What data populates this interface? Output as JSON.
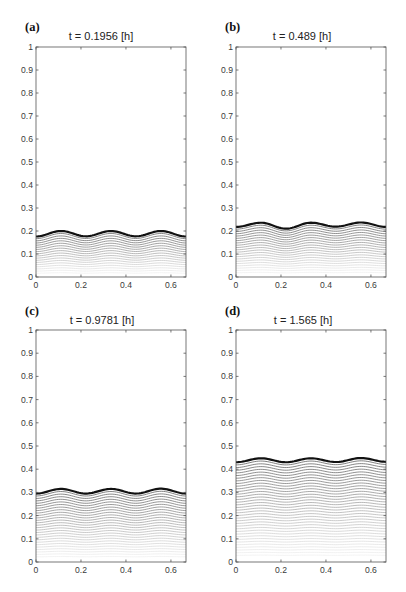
{
  "figure": {
    "panels": [
      {
        "label": "(a)",
        "title": "t = 0.1956 [h]"
      },
      {
        "label": "(b)",
        "title": "t = 0.489 [h]"
      },
      {
        "label": "(c)",
        "title": "t = 0.9781 [h]"
      },
      {
        "label": "(d)",
        "title": "t = 1.565 [h]"
      }
    ]
  },
  "chart_data": [
    {
      "type": "line",
      "panel": "(a)",
      "title": "t = 0.1956 [h]",
      "xlabel": "",
      "ylabel": "",
      "xlim": [
        0,
        0.667
      ],
      "ylim": [
        0,
        1
      ],
      "xticks": [
        0,
        0.2,
        0.4,
        0.6
      ],
      "xtick_labels": [
        "0",
        "0.2",
        "0.4",
        "0.6"
      ],
      "yticks": [
        0,
        0.1,
        0.2,
        0.3,
        0.4,
        0.5,
        0.6,
        0.7,
        0.8,
        0.9,
        1
      ],
      "ytick_labels": [
        "0",
        "0.1",
        "0.2",
        "0.3",
        "0.4",
        "0.5",
        "0.6",
        "0.7",
        "0.8",
        "0.9",
        "1"
      ],
      "grid": false,
      "legend": null,
      "layer_count": 18,
      "series": [
        {
          "name": "interface (current)",
          "x": [
            0,
            0.111,
            0.222,
            0.333,
            0.444,
            0.556,
            0.667
          ],
          "y": [
            0.176,
            0.2,
            0.177,
            0.2,
            0.177,
            0.2,
            0.176
          ]
        }
      ]
    },
    {
      "type": "line",
      "panel": "(b)",
      "title": "t = 0.489 [h]",
      "xlabel": "",
      "ylabel": "",
      "xlim": [
        0,
        0.667
      ],
      "ylim": [
        0,
        1
      ],
      "xticks": [
        0,
        0.2,
        0.4,
        0.6
      ],
      "xtick_labels": [
        "0",
        "0.2",
        "0.4",
        "0.6"
      ],
      "yticks": [
        0,
        0.1,
        0.2,
        0.3,
        0.4,
        0.5,
        0.6,
        0.7,
        0.8,
        0.9,
        1
      ],
      "ytick_labels": [
        "0",
        "0.1",
        "0.2",
        "0.3",
        "0.4",
        "0.5",
        "0.6",
        "0.7",
        "0.8",
        "0.9",
        "1"
      ],
      "grid": false,
      "legend": null,
      "layer_count": 21,
      "series": [
        {
          "name": "interface (current)",
          "x": [
            0,
            0.111,
            0.222,
            0.333,
            0.444,
            0.556,
            0.667
          ],
          "y": [
            0.218,
            0.236,
            0.21,
            0.236,
            0.219,
            0.237,
            0.218
          ]
        }
      ]
    },
    {
      "type": "line",
      "panel": "(c)",
      "title": "t = 0.9781 [h]",
      "xlabel": "",
      "ylabel": "",
      "xlim": [
        0,
        0.667
      ],
      "ylim": [
        0,
        1
      ],
      "xticks": [
        0,
        0.2,
        0.4,
        0.6
      ],
      "xtick_labels": [
        "0",
        "0.2",
        "0.4",
        "0.6"
      ],
      "yticks": [
        0,
        0.1,
        0.2,
        0.3,
        0.4,
        0.5,
        0.6,
        0.7,
        0.8,
        0.9,
        1
      ],
      "ytick_labels": [
        "0",
        "0.1",
        "0.2",
        "0.3",
        "0.4",
        "0.5",
        "0.6",
        "0.7",
        "0.8",
        "0.9",
        "1"
      ],
      "grid": false,
      "legend": null,
      "layer_count": 27,
      "series": [
        {
          "name": "interface (current)",
          "x": [
            0,
            0.111,
            0.222,
            0.333,
            0.444,
            0.556,
            0.667
          ],
          "y": [
            0.295,
            0.315,
            0.295,
            0.315,
            0.295,
            0.316,
            0.295
          ]
        }
      ]
    },
    {
      "type": "line",
      "panel": "(d)",
      "title": "t = 1.565 [h]",
      "xlabel": "",
      "ylabel": "",
      "xlim": [
        0,
        0.667
      ],
      "ylim": [
        0,
        1
      ],
      "xticks": [
        0,
        0.2,
        0.4,
        0.6
      ],
      "xtick_labels": [
        "0",
        "0.2",
        "0.4",
        "0.6"
      ],
      "yticks": [
        0,
        0.1,
        0.2,
        0.3,
        0.4,
        0.5,
        0.6,
        0.7,
        0.8,
        0.9,
        1
      ],
      "ytick_labels": [
        "0",
        "0.1",
        "0.2",
        "0.3",
        "0.4",
        "0.5",
        "0.6",
        "0.7",
        "0.8",
        "0.9",
        "1"
      ],
      "grid": false,
      "legend": null,
      "layer_count": 36,
      "series": [
        {
          "name": "interface (current)",
          "x": [
            0,
            0.111,
            0.222,
            0.333,
            0.444,
            0.556,
            0.667
          ],
          "y": [
            0.43,
            0.447,
            0.43,
            0.447,
            0.431,
            0.448,
            0.432
          ]
        }
      ]
    }
  ]
}
